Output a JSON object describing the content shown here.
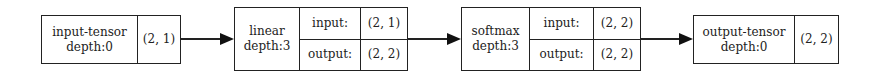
{
  "diagram": {
    "nodes": [
      {
        "id": "input-tensor",
        "name": "input-tensor",
        "depth": "depth:0",
        "shape": "(2, 1)"
      },
      {
        "id": "linear",
        "name": "linear",
        "depth": "depth:3",
        "input_label": "input:",
        "input_shape": "(2, 1)",
        "output_label": "output:",
        "output_shape": "(2, 2)"
      },
      {
        "id": "softmax",
        "name": "softmax",
        "depth": "depth:3",
        "input_label": "input:",
        "input_shape": "(2, 2)",
        "output_label": "output:",
        "output_shape": "(2, 2)"
      },
      {
        "id": "output-tensor",
        "name": "output-tensor",
        "depth": "depth:0",
        "shape": "(2, 2)"
      }
    ],
    "edges": [
      {
        "from": "input-tensor",
        "to": "linear"
      },
      {
        "from": "linear",
        "to": "softmax"
      },
      {
        "from": "softmax",
        "to": "output-tensor"
      }
    ],
    "colors": {
      "stroke": "#222222",
      "background": "#ffffff"
    }
  }
}
